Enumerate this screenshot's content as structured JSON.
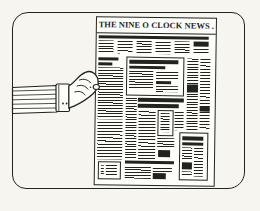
{
  "newspaper": {
    "masthead": "THE NINE O CLOCK NEWS ."
  },
  "colors": {
    "background": "#f6f5f0",
    "paper": "#fdfdfa",
    "ink": "#23231e"
  }
}
